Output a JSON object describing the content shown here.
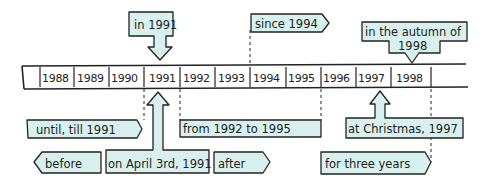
{
  "timeline": {
    "years": [
      "1988",
      "1989",
      "1990",
      "1991",
      "1992",
      "1993",
      "1994",
      "1995",
      "1996",
      "1997",
      "1998"
    ]
  },
  "labels": {
    "in_1991": "in 1991",
    "since_1994": "since 1994",
    "autumn_line1": "in the autumn of",
    "autumn_line2": "1998",
    "until_till": "until, till 1991",
    "from_to": "from 1992 to 1995",
    "at_christmas": "at Christmas, 1997",
    "before": "before",
    "on_april": "on April 3rd, 1991",
    "after": "after",
    "for_three_years": "for three years"
  },
  "colors": {
    "label_fill": "#d9f1ee",
    "outline": "#222222",
    "background": "#ffffff"
  }
}
